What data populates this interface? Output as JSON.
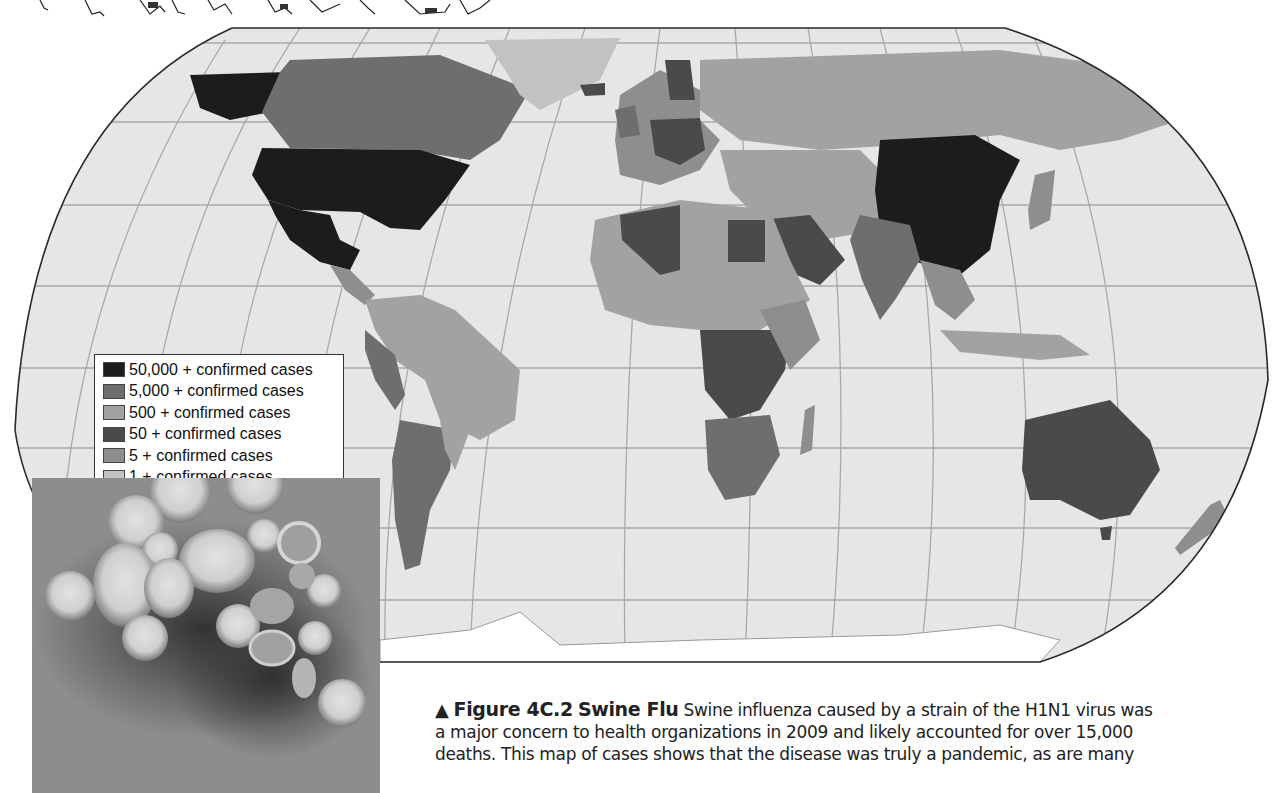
{
  "figure": {
    "marker": "▲",
    "label": "Figure 4C.2",
    "title": "Swine Flu",
    "caption_line1": "Swine influenza caused by a strain of the H1N1 virus was",
    "caption_line2": "a major concern to health organizations in 2009 and likely accounted for over 15,000",
    "caption_line3": "deaths. This map of cases shows that the disease was truly a pandemic, as are many"
  },
  "legend": {
    "items": [
      {
        "label": "50,000 + confirmed cases",
        "color": "#1c1c1c"
      },
      {
        "label": "5,000 + confirmed cases",
        "color": "#6e6e6e"
      },
      {
        "label": "500 + confirmed cases",
        "color": "#a2a2a2"
      },
      {
        "label": "50 + confirmed cases",
        "color": "#4a4a4a"
      },
      {
        "label": "5 + confirmed cases",
        "color": "#8e8e8e"
      },
      {
        "label": "1 + confirmed cases",
        "color": "#c2c2c2"
      }
    ]
  },
  "map": {
    "ocean_color": "#e6e6e6",
    "regions": [
      {
        "name": "United States",
        "category": "50,000 +"
      },
      {
        "name": "Mexico",
        "category": "50,000 +"
      },
      {
        "name": "China",
        "category": "50,000 +"
      },
      {
        "name": "Canada",
        "category": "5,000 +"
      },
      {
        "name": "Australia",
        "category": "5,000 +"
      },
      {
        "name": "Russia",
        "category": "500 +"
      },
      {
        "name": "Brazil",
        "category": "500 +"
      },
      {
        "name": "Argentina",
        "category": "5,000 +"
      },
      {
        "name": "India",
        "category": "5,000 +"
      },
      {
        "name": "Greenland",
        "category": "1 +"
      }
    ]
  },
  "photo": {
    "description": "electron micrograph of H1N1 virus particles"
  }
}
